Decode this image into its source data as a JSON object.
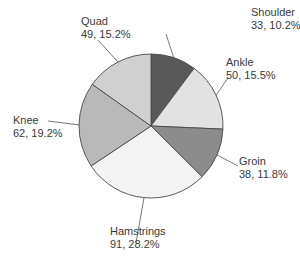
{
  "chart_data": {
    "type": "pie",
    "title": "",
    "start_angle": "12 o'clock",
    "direction": "clockwise",
    "categories": [
      "Shoulder",
      "Ankle",
      "Groin",
      "Hamstrings",
      "Knee",
      "Quad"
    ],
    "values": [
      33,
      50,
      38,
      91,
      62,
      49
    ],
    "percentages": [
      10.2,
      15.5,
      11.8,
      28.2,
      19.2,
      15.2
    ],
    "total": 323,
    "legend": "none (direct labels with leader lines)",
    "slices": [
      {
        "name": "Shoulder",
        "value": 33,
        "percent": 10.2,
        "color": "#585858",
        "value_text": "33, 10.2%"
      },
      {
        "name": "Ankle",
        "value": 50,
        "percent": 15.5,
        "color": "#e2e2e2",
        "value_text": "50, 15.5%"
      },
      {
        "name": "Groin",
        "value": 38,
        "percent": 11.8,
        "color": "#8c8c8c",
        "value_text": "38, 11.8%"
      },
      {
        "name": "Hamstrings",
        "value": 91,
        "percent": 28.2,
        "color": "#f3f3f3",
        "value_text": "91, 28.2%"
      },
      {
        "name": "Knee",
        "value": 62,
        "percent": 19.2,
        "color": "#b9b9b9",
        "value_text": "62, 19.2%"
      },
      {
        "name": "Quad",
        "value": 49,
        "percent": 15.2,
        "color": "#d0d0d0",
        "value_text": "49, 15.2%"
      }
    ]
  },
  "style": {
    "outline_color": "#4a4a4a",
    "leader_color": "#555555",
    "text_color": "#3a3a3a"
  }
}
